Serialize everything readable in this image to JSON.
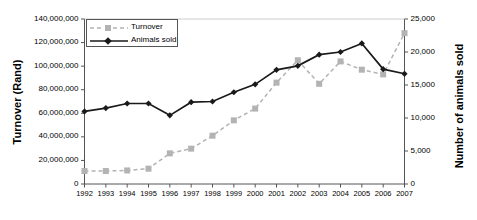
{
  "chart_data": {
    "type": "line",
    "title": "",
    "xlabel": "",
    "categories": [
      "1992",
      "1993",
      "1994",
      "1995",
      "1996",
      "1997",
      "1998",
      "1999",
      "2000",
      "2001",
      "2002",
      "2003",
      "2004",
      "2005",
      "2006",
      "2007"
    ],
    "grid": false,
    "legend_position": "top-left",
    "axes": {
      "left": {
        "label": "Turnover (Rand)",
        "min": 0,
        "max": 140000000,
        "step": 20000000,
        "ticks": [
          "0",
          "20,000,000",
          "40,000,000",
          "60,000,000",
          "80,000,000",
          "100,000,000",
          "120,000,000",
          "140,000,000"
        ],
        "tick_values": [
          0,
          20000000,
          40000000,
          60000000,
          80000000,
          100000000,
          120000000,
          140000000
        ]
      },
      "right": {
        "label": "Number of animals sold",
        "min": 0,
        "max": 25000,
        "step": 5000,
        "ticks": [
          "0",
          "5,000",
          "10,000",
          "15,000",
          "20,000",
          "25,000"
        ],
        "tick_values": [
          0,
          5000,
          10000,
          15000,
          20000,
          25000
        ]
      }
    },
    "series": [
      {
        "name": "Turnover",
        "axis": "left",
        "color": "#b3b3b3",
        "marker": "square",
        "line_style": "dashed",
        "values": [
          11000000,
          11000000,
          11500000,
          13000000,
          26000000,
          30000000,
          41000000,
          54000000,
          64000000,
          86000000,
          105000000,
          85000000,
          104000000,
          97000000,
          93000000,
          128000000
        ]
      },
      {
        "name": "Animals sold",
        "axis": "right",
        "color": "#1a1a1a",
        "marker": "diamond",
        "line_style": "solid",
        "values": [
          11000,
          11500,
          12200,
          12200,
          10400,
          12400,
          12500,
          13900,
          15100,
          17300,
          17900,
          19600,
          20000,
          21300,
          17400,
          16700
        ]
      }
    ]
  },
  "legend": {
    "items": [
      {
        "label": "Turnover"
      },
      {
        "label": "Animals sold"
      }
    ]
  }
}
